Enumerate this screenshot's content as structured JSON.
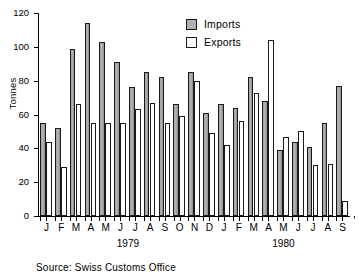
{
  "chart_data": {
    "type": "bar",
    "title": "",
    "subtitle": "",
    "xlabel": "",
    "ylabel": "Tonnes",
    "ylim": [
      0,
      120
    ],
    "yticks": [
      0,
      20,
      40,
      60,
      80,
      100,
      120
    ],
    "grid": false,
    "legend_position": "top-right",
    "categories": [
      "J",
      "F",
      "M",
      "A",
      "M",
      "J",
      "J",
      "A",
      "S",
      "O",
      "N",
      "D",
      "J",
      "F",
      "M",
      "A",
      "M",
      "J",
      "J",
      "A",
      "S"
    ],
    "group_labels": [
      "1979",
      "1980"
    ],
    "group_spans": [
      12,
      9
    ],
    "series": [
      {
        "name": "Imports",
        "color": "#b0b0b0",
        "values": [
          55,
          52,
          99,
          114,
          103,
          91,
          76,
          85,
          82,
          66,
          85,
          61,
          66,
          64,
          82,
          68,
          39,
          44,
          41,
          55,
          77
        ]
      },
      {
        "name": "Exports",
        "color": "#ffffff",
        "values": [
          44,
          29,
          66,
          55,
          55,
          55,
          63,
          67,
          55,
          59,
          80,
          49,
          42,
          56,
          73,
          104,
          47,
          50,
          30,
          31,
          9
        ]
      }
    ],
    "annotations": [
      {
        "text": "Source: Swiss Customs Office"
      }
    ]
  },
  "axis": {
    "y_label": "Tonnes",
    "y_ticks": [
      "0",
      "20",
      "40",
      "60",
      "80",
      "100",
      "120"
    ]
  },
  "legend": {
    "imports_label": "Imports",
    "exports_label": "Exports"
  },
  "footer": {
    "source": "Source: Swiss Customs Office"
  }
}
